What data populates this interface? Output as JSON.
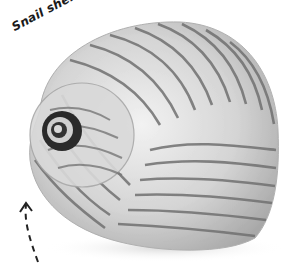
{
  "image": {
    "subject": "snail shell",
    "label": "Snail shell",
    "colors": {
      "background": "#ffffff",
      "shell_light": "#e6e6e6",
      "shell_mid": "#bdbdbd",
      "stripe": "#6e6e6e",
      "apex": "#1f1f1f",
      "label_text": "#1a1a1a",
      "arrow": "#222222"
    }
  }
}
